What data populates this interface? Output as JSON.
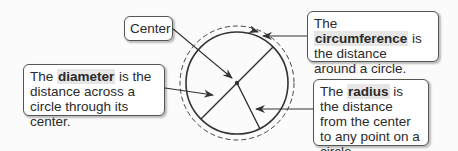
{
  "diagram": {
    "circle": {
      "cx": 237,
      "cy": 83,
      "r": 51,
      "dashed_r": 57,
      "stroke": "#333333"
    },
    "labels": {
      "center": {
        "text": "Center"
      },
      "circumference": {
        "pre": "The ",
        "term": "circumference",
        "post": " is the distance around a circle."
      },
      "diameter": {
        "pre": "The ",
        "term": "diameter",
        "post": " is the distance across a circle through its center."
      },
      "radius": {
        "pre": "The ",
        "term": "radius",
        "post": " is the distance from the center to any point on a circle."
      }
    }
  }
}
